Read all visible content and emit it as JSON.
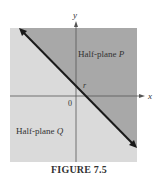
{
  "figure": {
    "caption": "FIGURE 7.5",
    "axes": {
      "x_label": "x",
      "y_label": "y",
      "origin_label": "0"
    },
    "line_label": "r",
    "regions": {
      "upper": {
        "label_prefix": "Half-plane ",
        "label_var": "P",
        "color": "#a8a8a8"
      },
      "lower": {
        "label_prefix": "Half-plane ",
        "label_var": "Q",
        "color": "#dadada"
      }
    },
    "colors": {
      "line": "#1a1a1a",
      "axis": "#555555",
      "text": "#333333"
    }
  }
}
